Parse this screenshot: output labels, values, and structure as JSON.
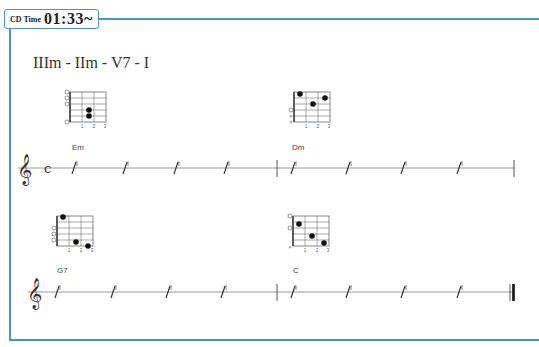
{
  "badge": {
    "label": "CD Time",
    "time": "01:33~"
  },
  "title": "IIIm - IIm - V7 - I",
  "colors": {
    "accent": "#4a90d9",
    "staff": "#888888",
    "text": "#333333"
  },
  "rows": [
    {
      "time_signature": "c",
      "chords": [
        {
          "name": "Em",
          "fret_labels": [
            "1",
            "2",
            "3"
          ],
          "open": [
            1,
            2,
            3,
            6
          ],
          "muted": [],
          "dots": [
            {
              "string": 5,
              "fret": 2
            },
            {
              "string": 4,
              "fret": 2
            }
          ]
        },
        {
          "name": "Dm",
          "fret_labels": [
            "1",
            "2",
            "3"
          ],
          "open": [
            4
          ],
          "muted": [
            5,
            6
          ],
          "dots": [
            {
              "string": 1,
              "fret": 1
            },
            {
              "string": 3,
              "fret": 2
            },
            {
              "string": 2,
              "fret": 3
            }
          ]
        }
      ],
      "ending": "single-bar"
    },
    {
      "time_signature": "",
      "chords": [
        {
          "name": "G7",
          "fret_labels": [
            "1",
            "2",
            "3"
          ],
          "open": [
            2,
            3,
            4
          ],
          "muted": [],
          "dots": [
            {
              "string": 1,
              "fret": 1
            },
            {
              "string": 5,
              "fret": 2
            },
            {
              "string": 6,
              "fret": 3
            }
          ]
        },
        {
          "name": "C",
          "fret_labels": [
            "1",
            "2",
            "3"
          ],
          "open": [
            1,
            3
          ],
          "muted": [
            6
          ],
          "dots": [
            {
              "string": 2,
              "fret": 1
            },
            {
              "string": 4,
              "fret": 2
            },
            {
              "string": 5,
              "fret": 3
            }
          ]
        }
      ],
      "ending": "final-double-bar"
    }
  ]
}
